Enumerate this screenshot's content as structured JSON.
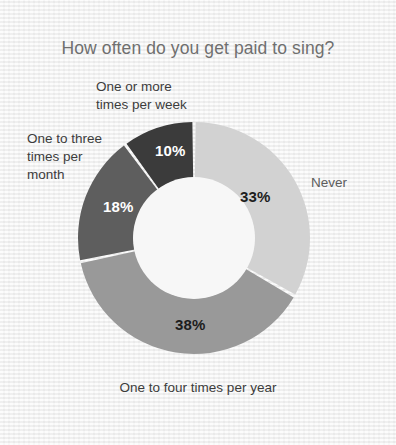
{
  "chart_data": {
    "type": "pie",
    "variant": "donut",
    "title": "How often do you get paid to sing?",
    "xlabel": "",
    "ylabel": "",
    "units": "percent",
    "start_angle_deg": 0,
    "direction": "clockwise",
    "inner_radius_ratio": 0.52,
    "legend": "none",
    "grid": false,
    "categories": [
      "Never",
      "One to four times per year",
      "One to three times per month",
      "One or more times per week"
    ],
    "values": [
      33,
      38,
      18,
      10
    ],
    "value_labels": [
      "33%",
      "38%",
      "18%",
      "10%"
    ],
    "colors": [
      "#d2d2d2",
      "#999999",
      "#5e5e5e",
      "#3b3b3b"
    ],
    "slices": [
      {
        "label": "Never",
        "label_lines": "Never",
        "value": 33,
        "value_label": "33%",
        "color": "#d2d2d2",
        "value_text_color": "#1d1d1d"
      },
      {
        "label": "One to four times per year",
        "label_lines": "One to four times per year",
        "value": 38,
        "value_label": "38%",
        "color": "#999999",
        "value_text_color": "#1d1d1d"
      },
      {
        "label": "One to three times per month",
        "label_lines": "One to three\ntimes per\nmonth",
        "value": 18,
        "value_label": "18%",
        "color": "#5e5e5e",
        "value_text_color": "#ffffff"
      },
      {
        "label": "One or more times per week",
        "label_lines": "One or more\ntimes per week",
        "value": 10,
        "value_label": "10%",
        "color": "#3b3b3b",
        "value_text_color": "#ffffff"
      }
    ]
  },
  "figure": {
    "background_color": "#f3f3f3",
    "title_color": "#6f6f6f",
    "label_color": "#3c3c3c",
    "never_label_color": "#5d5d5d",
    "separator_color": "#f3f3f3",
    "hub_color": "#f7f7f7"
  }
}
